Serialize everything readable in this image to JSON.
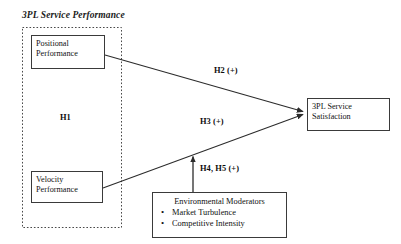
{
  "diagram": {
    "title": "3PL Service Performance",
    "colors": {
      "background": "#ffffff",
      "box_border": "#3a3a3a",
      "dashed_border": "#4a4a4a",
      "line": "#2b2b2b",
      "text": "#111111"
    },
    "group": {
      "name": "3PL Service Performance",
      "inner_label": "H1",
      "border_style": "dashed"
    },
    "nodes": [
      {
        "id": "positional",
        "line1": "Positional",
        "line2": "Performance",
        "shape": "rectangle"
      },
      {
        "id": "velocity",
        "line1": "Velocity",
        "line2": "Performance",
        "shape": "rectangle"
      },
      {
        "id": "satisfaction",
        "line1": "3PL Service",
        "line2": "Satisfaction",
        "shape": "rectangle"
      }
    ],
    "moderator_box": {
      "title": "Environmental Moderators",
      "bullet_glyph": "•",
      "items": [
        "Market Turbulence",
        "Competitive Intensity"
      ]
    },
    "edges": [
      {
        "id": "h2",
        "label": "H2 (+)",
        "from": "positional",
        "to": "satisfaction",
        "arrow": "end"
      },
      {
        "id": "h3",
        "label": "H3 (+)",
        "from": "velocity",
        "to": "satisfaction",
        "arrow": "end"
      },
      {
        "id": "h4h5",
        "label": "H4, H5 (+)",
        "from": "moderator_box",
        "to": "h3",
        "arrow": "end"
      }
    ]
  }
}
